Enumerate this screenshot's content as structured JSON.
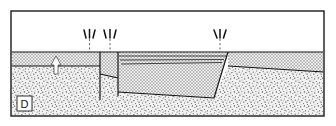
{
  "figure": {
    "panel_label": "D",
    "frame": {
      "x": 11,
      "y": 11,
      "width": 313,
      "height": 105,
      "stroke": "#1a1a1a",
      "stroke_width": 1.4
    },
    "background_color": "#ffffff",
    "layers": [
      {
        "name": "air-open-space",
        "fill_kind": "solid-white",
        "color": "#ffffff",
        "top": 11,
        "bottom": 52
      },
      {
        "name": "cross-hatch-unit",
        "fill_kind": "cross-hatch",
        "color": "#8a8a8a",
        "top": 52,
        "bottom": 82
      },
      {
        "name": "stipple-basement-unit",
        "fill_kind": "stipple",
        "color": "#6e6e6e",
        "top": 70,
        "bottom": 116
      }
    ],
    "markers": {
      "extension_arrow_groups": [
        {
          "name": "extension-marks-left",
          "x": 88,
          "y": 31,
          "count": 3,
          "label": ""
        },
        {
          "name": "extension-marks-center",
          "x": 110,
          "y": 31,
          "count": 3,
          "label": ""
        },
        {
          "name": "extension-marks-right",
          "x": 220,
          "y": 31,
          "count": 3,
          "label": ""
        }
      ],
      "uplift_arrow": {
        "name": "uplift-arrow",
        "x": 56,
        "y": 62,
        "direction": "up",
        "color": "#ffffff"
      }
    },
    "faults": [
      {
        "name": "fault-left-master",
        "kind": "normal-fault",
        "x1": 100,
        "y1": 52,
        "x2": 100,
        "y2": 100
      },
      {
        "name": "fault-left-antithetic",
        "kind": "normal-fault",
        "x1": 118,
        "y1": 52,
        "x2": 118,
        "y2": 96
      },
      {
        "name": "fault-right-master",
        "kind": "normal-fault",
        "x1": 228,
        "y1": 52,
        "x2": 214,
        "y2": 98
      },
      {
        "name": "fault-basal-detachment",
        "kind": "detachment",
        "x1": 118,
        "y1": 92,
        "x2": 228,
        "y2": 70
      }
    ],
    "blocks": [
      {
        "name": "rotated-hanging-wall-block",
        "kind": "tilted-fault-block"
      },
      {
        "name": "footwall-block-left",
        "kind": "footwall"
      },
      {
        "name": "footwall-block-right",
        "kind": "footwall"
      }
    ]
  }
}
